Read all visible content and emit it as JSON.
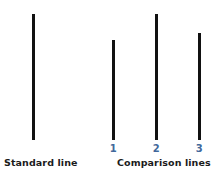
{
  "figure": {
    "background_color": "#ffffff",
    "line_color": "#111111",
    "label_color": "#1b1b1b",
    "tick_color": "#41689b",
    "standard_group": {
      "caption": "Standard line",
      "line": {
        "name": "standard-line",
        "x": 32,
        "top": 14,
        "bottom": 140,
        "height": 126,
        "width": 2.5
      }
    },
    "comparison_group": {
      "caption": "Comparison lines",
      "lines": [
        {
          "name": "comparison-line-1",
          "label": "1",
          "x": 112,
          "top": 40,
          "bottom": 140,
          "height": 100,
          "width": 2.5
        },
        {
          "name": "comparison-line-2",
          "label": "2",
          "x": 155,
          "top": 14,
          "bottom": 140,
          "height": 126,
          "width": 2.5
        },
        {
          "name": "comparison-line-3",
          "label": "3",
          "x": 198,
          "top": 33,
          "bottom": 140,
          "height": 107,
          "width": 2.5
        }
      ]
    }
  },
  "chart_data": {
    "type": "bar",
    "title": "",
    "xlabel": "",
    "ylabel": "",
    "orientation": "vertical",
    "grid": false,
    "categories": [
      "Standard",
      "1",
      "2",
      "3"
    ],
    "values": [
      126,
      100,
      126,
      107
    ],
    "units": "pixels",
    "groups": [
      {
        "name": "Standard line",
        "categories": [
          "Standard"
        ],
        "values": [
          126
        ]
      },
      {
        "name": "Comparison lines",
        "categories": [
          "1",
          "2",
          "3"
        ],
        "values": [
          100,
          126,
          107
        ]
      }
    ]
  }
}
